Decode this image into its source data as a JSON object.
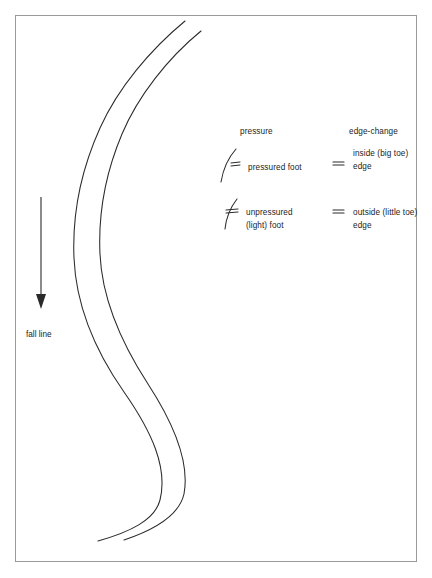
{
  "page": {
    "background_color": "#ffffff",
    "ink_color": "#1a1a1a",
    "frame_color": "#9a9a9a"
  },
  "fall_line": {
    "label": "fall line",
    "arrow_icon": "down-arrow-icon",
    "direction": "down"
  },
  "track": {
    "name": "ski-track",
    "description": "two parallel S-shaped ski track curves",
    "line_count": 2
  },
  "legend": {
    "columns": [
      {
        "heading": "pressure"
      },
      {
        "heading": "edge-change"
      }
    ],
    "rows": [
      {
        "symbol_name": "pressured-foot-arc-icon",
        "pressure_label_line1": "pressured foot",
        "pressure_label_line2": "",
        "edge_symbol_name": "equals-icon",
        "edge_label_line1": "inside (big toe)",
        "edge_label_line2": "edge"
      },
      {
        "symbol_name": "unpressured-foot-arc-icon",
        "pressure_label_line1": "unpressured",
        "pressure_label_line2": "(light) foot",
        "edge_symbol_name": "equals-icon",
        "edge_label_line1": "outside (little toe)",
        "edge_label_line2": "edge"
      }
    ]
  }
}
